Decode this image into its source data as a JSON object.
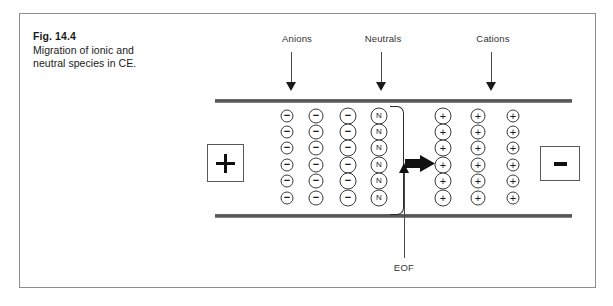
{
  "figure": {
    "caption_title": "Fig. 14.4",
    "caption_line1": "Migration of ionic and",
    "caption_line2": "neutral species in CE."
  },
  "labels": {
    "anions": "Anions",
    "neutrals": "Neutrals",
    "cations": "Cations",
    "eof": "EOF"
  },
  "electrodes": {
    "anode_symbol": "+",
    "cathode_symbol": "−",
    "anode_name": "positive-electrode",
    "cathode_name": "negative-electrode"
  },
  "species": {
    "anion_glyph": "−",
    "neutral_glyph": "N",
    "cation_glyph": "+"
  },
  "icons": {
    "down_arrow": "down-arrow-icon",
    "up_arrow": "up-arrow-icon",
    "eof_block_arrow": "right-block-arrow-icon"
  },
  "colors": {
    "wall": "#4a4a4a",
    "outline": "#3a3a3a",
    "frame": "#8d8d8d",
    "text": "#333333"
  },
  "diagram": {
    "type": "capillary-electrophoresis-schematic",
    "anion_columns": [
      {
        "x": 287,
        "size": "sm",
        "count": 6
      },
      {
        "x": 316,
        "size": "md",
        "count": 6
      },
      {
        "x": 348,
        "size": "lg",
        "count": 6
      }
    ],
    "neutral_columns": [
      {
        "x": 379,
        "size": "lg",
        "count": 6
      }
    ],
    "cation_columns": [
      {
        "x": 443,
        "size": "lg",
        "count": 6
      },
      {
        "x": 478,
        "size": "md",
        "count": 6
      },
      {
        "x": 513,
        "size": "sm",
        "count": 6
      }
    ],
    "rows_y": [
      116,
      132,
      148,
      165,
      181,
      198
    ],
    "top_label_x": {
      "anions": 297,
      "neutrals": 383,
      "cations": 493
    }
  }
}
